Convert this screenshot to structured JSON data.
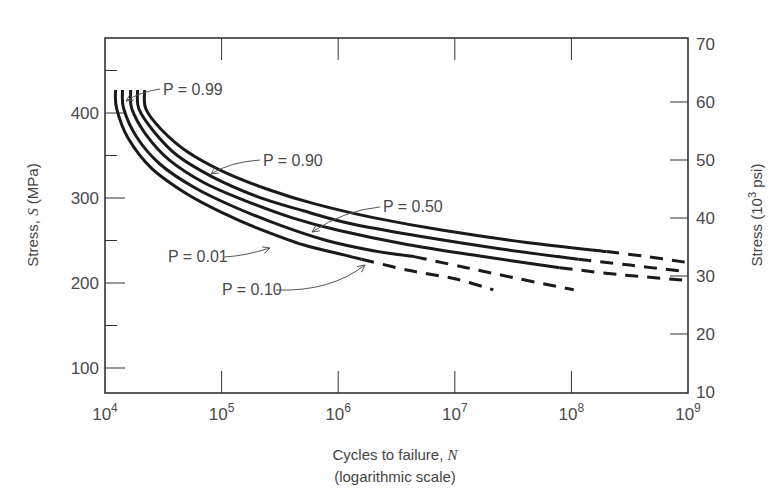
{
  "chart_data": {
    "type": "line",
    "title": "",
    "xlabel": "Cycles to failure, N",
    "xlabel_plain": "Cycles to failure, ",
    "xlabel_var": "N",
    "xlabel_sub": "(logarithmic scale)",
    "ylabel": "Stress, S (MPa)",
    "ylabel_left_plain": "Stress, ",
    "ylabel_left_var": "S",
    "ylabel_left_unit": " (MPa)",
    "ylabel_right": "Stress (10^3 psi)",
    "ylabel_right_pre": "Stress (10",
    "ylabel_right_sup": "3",
    "ylabel_right_post": " psi)",
    "xscale": "log",
    "xlim": [
      10000,
      1000000000
    ],
    "ylim": [
      65,
      485
    ],
    "ylim_right": [
      10,
      70
    ],
    "grid": false,
    "legend": "inline annotations",
    "x_ticks": [
      {
        "base": "10",
        "exp": "4",
        "log": 4
      },
      {
        "base": "10",
        "exp": "5",
        "log": 5
      },
      {
        "base": "10",
        "exp": "6",
        "log": 6
      },
      {
        "base": "10",
        "exp": "7",
        "log": 7
      },
      {
        "base": "10",
        "exp": "8",
        "log": 8
      },
      {
        "base": "10",
        "exp": "9",
        "log": 9
      }
    ],
    "y_ticks_left": [
      100,
      200,
      300,
      400
    ],
    "y_minor_ticks_left": [
      150,
      250,
      350,
      450
    ],
    "y_ticks_right": [
      10,
      20,
      30,
      40,
      50,
      60,
      70
    ],
    "series": [
      {
        "name": "P = 0.01",
        "label": "P = 0.01",
        "solid": [
          [
            4.09,
            427
          ],
          [
            4.1,
            405
          ],
          [
            4.2,
            370
          ],
          [
            4.4,
            335
          ],
          [
            4.7,
            305
          ],
          [
            5.0,
            283
          ],
          [
            5.3,
            265
          ],
          [
            5.7,
            245
          ],
          [
            6.05,
            233
          ],
          [
            6.2,
            228
          ]
        ],
        "dashed": [
          [
            6.2,
            228
          ],
          [
            6.6,
            215
          ],
          [
            7.0,
            205
          ],
          [
            7.33,
            192
          ]
        ]
      },
      {
        "name": "P = 0.10",
        "label": "P = 0.10",
        "solid": [
          [
            4.15,
            427
          ],
          [
            4.16,
            405
          ],
          [
            4.27,
            372
          ],
          [
            4.47,
            340
          ],
          [
            4.77,
            312
          ],
          [
            5.1,
            290
          ],
          [
            5.5,
            268
          ],
          [
            5.9,
            250
          ],
          [
            6.3,
            238
          ],
          [
            6.65,
            231
          ]
        ],
        "dashed": [
          [
            6.65,
            231
          ],
          [
            7.1,
            218
          ],
          [
            7.55,
            205
          ],
          [
            8.02,
            192
          ]
        ]
      },
      {
        "name": "P = 0.50",
        "label": "P = 0.50",
        "solid": [
          [
            4.22,
            427
          ],
          [
            4.23,
            405
          ],
          [
            4.35,
            375
          ],
          [
            4.55,
            345
          ],
          [
            4.85,
            318
          ],
          [
            5.2,
            297
          ],
          [
            5.6,
            277
          ],
          [
            6.0,
            262
          ],
          [
            6.6,
            245
          ],
          [
            7.2,
            232
          ],
          [
            7.9,
            218
          ]
        ],
        "dashed": [
          [
            7.9,
            218
          ],
          [
            8.4,
            210
          ],
          [
            9.0,
            203
          ]
        ]
      },
      {
        "name": "P = 0.90",
        "label": "P = 0.90",
        "solid": [
          [
            4.28,
            427
          ],
          [
            4.29,
            405
          ],
          [
            4.42,
            378
          ],
          [
            4.62,
            350
          ],
          [
            4.92,
            325
          ],
          [
            5.3,
            302
          ],
          [
            5.7,
            285
          ],
          [
            6.1,
            270
          ],
          [
            6.7,
            255
          ],
          [
            7.4,
            240
          ],
          [
            8.06,
            228
          ]
        ],
        "dashed": [
          [
            8.06,
            228
          ],
          [
            8.5,
            221
          ],
          [
            9.0,
            213
          ]
        ]
      },
      {
        "name": "P = 0.99",
        "label": "P = 0.99",
        "solid": [
          [
            4.34,
            427
          ],
          [
            4.35,
            405
          ],
          [
            4.48,
            381
          ],
          [
            4.7,
            355
          ],
          [
            5.0,
            332
          ],
          [
            5.4,
            310
          ],
          [
            5.8,
            293
          ],
          [
            6.3,
            277
          ],
          [
            6.9,
            262
          ],
          [
            7.6,
            248
          ],
          [
            8.3,
            237
          ]
        ],
        "dashed": [
          [
            8.3,
            237
          ],
          [
            8.65,
            231
          ],
          [
            9.0,
            224
          ]
        ]
      }
    ],
    "annotations": [
      {
        "text": "P = 0.99",
        "text_x": 163,
        "text_y": 95,
        "arrow": [
          [
            160,
            89
          ],
          [
            140,
            92
          ],
          [
            126,
            101
          ]
        ]
      },
      {
        "text": "P = 0.90",
        "text_x": 263,
        "text_y": 166,
        "arrow": [
          [
            260,
            160
          ],
          [
            230,
            162
          ],
          [
            211,
            174
          ]
        ]
      },
      {
        "text": "P = 0.50",
        "text_x": 383,
        "text_y": 212,
        "arrow": [
          [
            380,
            207
          ],
          [
            345,
            210
          ],
          [
            312,
            232
          ]
        ]
      },
      {
        "text": "P = 0.01",
        "text_x": 168,
        "text_y": 262,
        "arrow": [
          [
            224,
            257
          ],
          [
            245,
            256
          ],
          [
            270,
            248
          ]
        ]
      },
      {
        "text": "P = 0.10",
        "text_x": 222,
        "text_y": 295,
        "arrow": [
          [
            276,
            290
          ],
          [
            330,
            292
          ],
          [
            365,
            265
          ]
        ]
      }
    ],
    "colors": {
      "curve": "#1a1a1a",
      "axis": "#333333",
      "text": "#4a4a4a",
      "arrow": "#555555"
    }
  }
}
